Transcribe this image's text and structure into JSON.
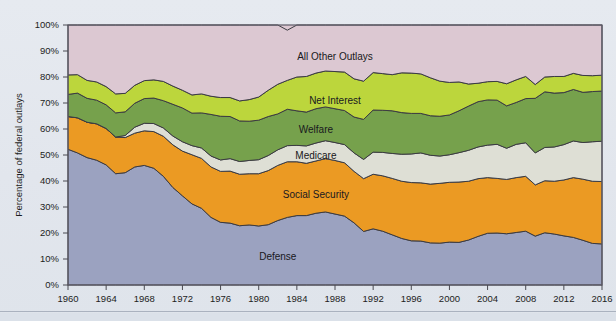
{
  "figure": {
    "background_color": "#e4e8ee",
    "plot_border_color": "#5d5a66"
  },
  "chart_data": {
    "type": "area",
    "stacked": true,
    "normalized_percent": true,
    "title": "",
    "subtitle": "",
    "xlabel": "",
    "ylabel": "Percentage of federal outlays",
    "xlim": [
      1960,
      2016
    ],
    "ylim": [
      0,
      100
    ],
    "grid": false,
    "legend_position": "inline-labels",
    "y_tick_labels": [
      "0%",
      "10%",
      "20%",
      "30%",
      "40%",
      "50%",
      "60%",
      "70%",
      "80%",
      "90%",
      "100%"
    ],
    "y_ticks": [
      0,
      10,
      20,
      30,
      40,
      50,
      60,
      70,
      80,
      90,
      100
    ],
    "x_tick_labels": [
      "1960",
      "1964",
      "1968",
      "1972",
      "1976",
      "1980",
      "1984",
      "1988",
      "1992",
      "1996",
      "2000",
      "2004",
      "2008",
      "2012",
      "2016"
    ],
    "x_ticks": [
      1960,
      1964,
      1968,
      1972,
      1976,
      1980,
      1984,
      1988,
      1992,
      1996,
      2000,
      2004,
      2008,
      2012,
      2016
    ],
    "x": [
      1960,
      1961,
      1962,
      1963,
      1964,
      1965,
      1966,
      1967,
      1968,
      1969,
      1970,
      1971,
      1972,
      1973,
      1974,
      1975,
      1976,
      1977,
      1978,
      1979,
      1980,
      1981,
      1982,
      1983,
      1984,
      1985,
      1986,
      1987,
      1988,
      1989,
      1990,
      1991,
      1992,
      1993,
      1994,
      1995,
      1996,
      1997,
      1998,
      1999,
      2000,
      2001,
      2002,
      2003,
      2004,
      2005,
      2006,
      2007,
      2008,
      2009,
      2010,
      2011,
      2012,
      2013,
      2014,
      2015,
      2016
    ],
    "series": [
      {
        "name": "Defense",
        "color": "#9ba2c0",
        "stack_order": 1,
        "values": [
          52.2,
          50.8,
          49.0,
          48.0,
          46.2,
          42.8,
          43.2,
          45.4,
          46.0,
          44.9,
          41.8,
          37.5,
          34.3,
          31.2,
          29.5,
          26.0,
          24.1,
          23.8,
          22.8,
          23.1,
          22.7,
          23.2,
          24.8,
          26.0,
          26.7,
          26.7,
          27.6,
          28.1,
          27.3,
          26.5,
          23.9,
          20.6,
          21.6,
          20.7,
          19.3,
          17.9,
          17.0,
          16.9,
          16.2,
          16.1,
          16.5,
          16.4,
          17.3,
          18.7,
          19.9,
          20.0,
          19.7,
          20.2,
          20.7,
          18.8,
          20.1,
          19.6,
          18.9,
          18.3,
          17.2,
          16.0,
          15.8
        ]
      },
      {
        "name": "Social Security",
        "color": "#eb9a23",
        "stack_order": 2,
        "values": [
          12.6,
          13.5,
          13.6,
          14.0,
          14.0,
          14.1,
          13.5,
          13.0,
          13.3,
          14.1,
          15.4,
          16.4,
          17.2,
          18.9,
          19.2,
          19.4,
          19.6,
          20.0,
          19.8,
          19.7,
          20.1,
          20.8,
          21.2,
          21.4,
          20.7,
          20.1,
          20.1,
          20.5,
          20.6,
          20.5,
          19.8,
          20.3,
          21.0,
          21.3,
          21.7,
          22.0,
          22.4,
          22.4,
          22.6,
          23.0,
          23.0,
          23.2,
          22.6,
          22.2,
          21.4,
          21.0,
          20.9,
          21.1,
          21.1,
          19.7,
          20.0,
          20.3,
          21.5,
          23.0,
          23.5,
          23.9,
          24.0
        ]
      },
      {
        "name": "Medicare",
        "color": "#dedfd5",
        "stack_order": 3,
        "values": [
          0.0,
          0.0,
          0.0,
          0.0,
          0.0,
          0.0,
          0.8,
          2.3,
          2.9,
          3.1,
          3.2,
          3.4,
          3.6,
          3.5,
          4.0,
          4.2,
          4.4,
          4.8,
          4.9,
          5.1,
          5.4,
          5.8,
          6.0,
          6.2,
          6.3,
          6.7,
          6.9,
          6.9,
          6.9,
          7.0,
          7.1,
          7.4,
          8.5,
          9.0,
          9.6,
          10.4,
          11.0,
          11.5,
          11.1,
          10.5,
          10.6,
          11.3,
          11.9,
          12.2,
          12.5,
          13.1,
          12.0,
          12.8,
          12.9,
          12.3,
          12.8,
          13.2,
          13.6,
          14.1,
          14.1,
          15.2,
          15.5
        ]
      },
      {
        "name": "Welfare",
        "color": "#76a14c",
        "stack_order": 4,
        "values": [
          8.5,
          9.5,
          9.2,
          9.1,
          9.1,
          9.3,
          9.1,
          9.2,
          9.5,
          9.8,
          10.5,
          12.2,
          13.0,
          12.5,
          13.5,
          16.0,
          16.8,
          16.2,
          15.6,
          15.1,
          15.2,
          15.0,
          13.8,
          14.0,
          13.3,
          13.0,
          13.2,
          13.0,
          13.0,
          13.1,
          13.8,
          15.4,
          16.2,
          16.2,
          16.4,
          16.0,
          15.6,
          15.2,
          15.2,
          15.3,
          15.3,
          16.1,
          17.0,
          17.4,
          17.4,
          17.0,
          16.3,
          16.1,
          17.0,
          21.0,
          21.4,
          20.7,
          20.0,
          19.8,
          19.3,
          19.3,
          19.3
        ]
      },
      {
        "name": "Net Interest",
        "color": "#bcd63c",
        "stack_order": 5,
        "values": [
          7.5,
          7.1,
          6.9,
          7.0,
          7.0,
          7.3,
          7.1,
          6.9,
          6.9,
          7.0,
          7.4,
          7.0,
          6.8,
          7.0,
          7.3,
          7.0,
          7.2,
          7.3,
          7.7,
          8.3,
          8.9,
          10.1,
          11.4,
          11.1,
          13.0,
          13.7,
          13.7,
          13.8,
          14.3,
          14.8,
          14.7,
          14.7,
          14.4,
          14.1,
          13.9,
          15.3,
          15.5,
          15.2,
          14.6,
          13.5,
          12.5,
          11.1,
          8.5,
          7.1,
          7.0,
          7.2,
          8.5,
          8.7,
          8.5,
          5.3,
          5.7,
          6.4,
          6.2,
          6.2,
          6.5,
          6.1,
          6.1
        ]
      },
      {
        "name": "All Other Outlays",
        "color": "#dcc8d2",
        "stack_order": 6,
        "values": [
          19.2,
          19.1,
          21.3,
          21.9,
          23.7,
          26.5,
          26.3,
          23.2,
          21.4,
          21.1,
          21.7,
          23.5,
          25.1,
          26.9,
          26.5,
          27.4,
          27.9,
          27.9,
          29.2,
          28.7,
          27.7,
          25.1,
          22.8,
          19.3,
          20.0,
          19.8,
          18.5,
          17.7,
          17.9,
          18.1,
          20.7,
          21.6,
          18.3,
          18.7,
          19.1,
          18.4,
          18.5,
          18.8,
          20.3,
          21.6,
          22.1,
          21.9,
          22.7,
          22.4,
          21.8,
          21.7,
          22.6,
          21.1,
          19.8,
          22.9,
          20.0,
          19.8,
          19.8,
          18.6,
          19.4,
          19.5,
          19.3
        ]
      }
    ],
    "annotations": [
      {
        "label": "All Other Outlays",
        "x": 1988,
        "y": 88
      },
      {
        "label": "Net Interest",
        "x": 1988,
        "y": 71
      },
      {
        "label": "Welfare",
        "x": 1986,
        "y": 60
      },
      {
        "label": "Medicare",
        "x": 1986,
        "y": 50
      },
      {
        "label": "Social Security",
        "x": 1986,
        "y": 35
      },
      {
        "label": "Defense",
        "x": 1982,
        "y": 11
      }
    ]
  }
}
